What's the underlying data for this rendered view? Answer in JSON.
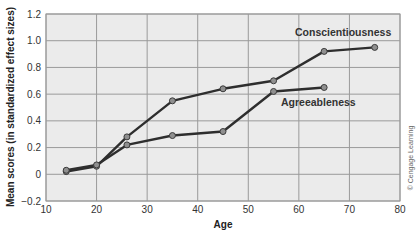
{
  "chart_data": {
    "type": "line",
    "title": "",
    "xlabel": "Age",
    "ylabel": "Mean scores (in standardized effect sizes)",
    "xlim": [
      10,
      80
    ],
    "ylim": [
      -0.2,
      1.2
    ],
    "x_ticks": [
      10,
      20,
      30,
      40,
      50,
      60,
      70,
      80
    ],
    "y_ticks": [
      -0.2,
      0,
      0.2,
      0.4,
      0.6,
      0.8,
      1.0,
      1.2
    ],
    "y_tick_labels": [
      "−0.2",
      "0",
      "0.2",
      "0.4",
      "0.6",
      "0.8",
      "1.0",
      "1.2"
    ],
    "grid": true,
    "legend_position": "inline labels",
    "series": [
      {
        "name": "Conscientiousness",
        "x": [
          14,
          20,
          26,
          35,
          45,
          55,
          65,
          75
        ],
        "values": [
          0.02,
          0.06,
          0.28,
          0.55,
          0.64,
          0.7,
          0.92,
          0.95
        ],
        "label_pos": [
          295,
          36
        ]
      },
      {
        "name": "Agreeableness",
        "x": [
          14,
          20,
          26,
          35,
          45,
          55,
          65
        ],
        "values": [
          0.03,
          0.07,
          0.22,
          0.29,
          0.32,
          0.62,
          0.65
        ],
        "label_pos": [
          281,
          106
        ]
      }
    ],
    "credit": "© Cengage Learning"
  },
  "colors": {
    "plot_bg": "#ebebeb",
    "grid": "#9a9a9a",
    "line": "#2e2e2e",
    "marker_fill": "#8f8f8f",
    "marker_stroke": "#3a3a3a"
  }
}
